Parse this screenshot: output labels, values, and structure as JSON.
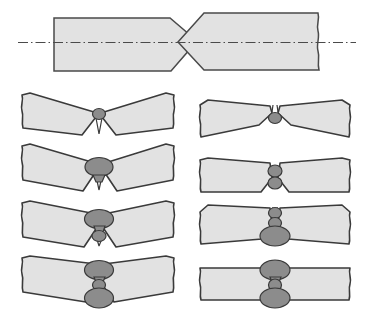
{
  "figure": {
    "canvas": {
      "width": 372,
      "height": 315
    },
    "colors": {
      "plate_fill": "#e2e2e2",
      "plate_stroke": "#3a3a3a",
      "bead_fill": "#8c8c8c",
      "bead_stroke": "#3a3a3a",
      "centerline": "#4a4a4a",
      "background": "#ffffff"
    },
    "panels": [
      {
        "id": "top-joint",
        "label": "unwelded-double-v-butt-joint",
        "row": 0,
        "column": "full",
        "angle_deg": 0,
        "beads": [],
        "has_centerline": true,
        "left_edge_type": "straight",
        "right_edge_type": "break-line",
        "groove_type": "double-V"
      },
      {
        "id": "left-1",
        "label": "left-pass-1",
        "row": 1,
        "column": "left",
        "angle_deg": 20,
        "beads": [
          {
            "name": "bead-root-small",
            "rx": 6.5,
            "ry": 5.5,
            "offset_y": 0
          }
        ],
        "has_centerline": false
      },
      {
        "id": "right-1",
        "label": "right-pass-1",
        "row": 1,
        "column": "right",
        "angle_deg": 11,
        "beads": [
          {
            "name": "bead-root-small",
            "rx": 6.5,
            "ry": 5.5,
            "offset_y": 0
          }
        ],
        "has_centerline": false
      },
      {
        "id": "left-2",
        "label": "left-pass-2",
        "row": 2,
        "column": "left",
        "angle_deg": 20,
        "beads": [
          {
            "name": "bead-large-top",
            "rx": 14,
            "ry": 9.5,
            "offset_y": -3
          }
        ],
        "has_centerline": false
      },
      {
        "id": "right-2",
        "label": "right-pass-2",
        "row": 2,
        "column": "right",
        "angle_deg": 3,
        "beads": [
          {
            "name": "bead-small-top",
            "rx": 7,
            "ry": 6,
            "offset_y": -6
          },
          {
            "name": "bead-small-bottom",
            "rx": 7,
            "ry": 6,
            "offset_y": 6
          }
        ],
        "has_centerline": false
      },
      {
        "id": "left-3",
        "label": "left-pass-3",
        "row": 3,
        "column": "left",
        "angle_deg": 18,
        "beads": [
          {
            "name": "bead-large-top",
            "rx": 14.5,
            "ry": 9.5,
            "offset_y": -8
          },
          {
            "name": "bead-small-bottom",
            "rx": 7,
            "ry": 5.5,
            "offset_y": 9
          }
        ],
        "has_centerline": false
      },
      {
        "id": "right-3",
        "label": "right-pass-3",
        "row": 3,
        "column": "right",
        "angle_deg": 5,
        "beads": [
          {
            "name": "bead-small-top-1",
            "rx": 6.5,
            "ry": 5.5,
            "offset_y": -14
          },
          {
            "name": "bead-small-top-2",
            "rx": 6.5,
            "ry": 5.5,
            "offset_y": -4
          },
          {
            "name": "bead-large-bottom",
            "rx": 15,
            "ry": 10,
            "offset_y": 9
          }
        ],
        "has_centerline": false
      },
      {
        "id": "left-4",
        "label": "left-pass-4",
        "row": 4,
        "column": "left",
        "angle_deg": 13,
        "beads": [
          {
            "name": "bead-large-top",
            "rx": 14.5,
            "ry": 9.5,
            "offset_y": -13
          },
          {
            "name": "bead-small-middle",
            "rx": 6.5,
            "ry": 5.5,
            "offset_y": 1
          },
          {
            "name": "bead-large-bottom",
            "rx": 14.5,
            "ry": 10,
            "offset_y": 15
          }
        ],
        "has_centerline": false
      },
      {
        "id": "right-4",
        "label": "right-pass-4",
        "row": 4,
        "column": "right",
        "angle_deg": 0,
        "beads": [
          {
            "name": "bead-large-top",
            "rx": 15,
            "ry": 10,
            "offset_y": -14
          },
          {
            "name": "bead-small-middle",
            "rx": 6.5,
            "ry": 6,
            "offset_y": 0
          },
          {
            "name": "bead-large-bottom",
            "rx": 15,
            "ry": 10,
            "offset_y": 14
          }
        ],
        "has_centerline": false
      }
    ]
  }
}
